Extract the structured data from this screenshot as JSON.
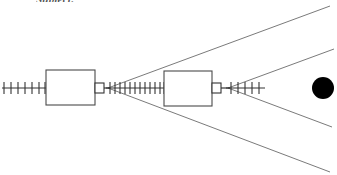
{
  "header": {
    "clipped_label": "Subject:"
  },
  "diagram": {
    "background_color": "#ffffff",
    "line_color": "#3a3a3a",
    "thin_line_color": "#6b6b6b",
    "fill_color": "#000000",
    "axis_y": 88,
    "elements": {
      "left_scale": {
        "name": "left-graduated-scale",
        "x_start": 2,
        "x_end": 46,
        "tick_count": 7,
        "tick_half_height": 6
      },
      "block_one": {
        "name": "optical-block-one",
        "x": 46,
        "y": 70,
        "width": 49,
        "height": 35,
        "label": ""
      },
      "connector_one": {
        "name": "connector-one",
        "x": 95,
        "y": 83,
        "width": 9,
        "height": 10
      },
      "vertex_one": {
        "name": "beam-vertex-one",
        "x": 108,
        "y": 88
      },
      "middle_scale": {
        "name": "middle-graduated-scale",
        "x_start": 108,
        "x_end": 164,
        "tick_count": 12,
        "tick_half_height": 6
      },
      "block_two": {
        "name": "optical-block-two",
        "x": 164,
        "y": 71,
        "width": 48,
        "height": 35,
        "label": ""
      },
      "connector_two": {
        "name": "connector-two",
        "x": 212,
        "y": 83,
        "width": 9,
        "height": 10
      },
      "vertex_two": {
        "name": "beam-vertex-two",
        "x": 228,
        "y": 88
      },
      "right_scale": {
        "name": "right-graduated-scale",
        "x_start": 228,
        "x_end": 265,
        "tick_count": 5,
        "tick_half_height": 6
      },
      "target_disc": {
        "name": "target-disc",
        "cx": 323,
        "cy": 88,
        "r": 11,
        "fill": "#000000"
      }
    },
    "beam_rays": [
      {
        "name": "ray-upper-outer",
        "from_vertex": "vertex_one",
        "x1": 108,
        "y1": 88,
        "x2": 330,
        "y2": 6
      },
      {
        "name": "ray-lower-outer",
        "from_vertex": "vertex_one",
        "x1": 108,
        "y1": 88,
        "x2": 330,
        "y2": 172
      },
      {
        "name": "ray-upper-inner",
        "from_vertex": "vertex_two",
        "x1": 228,
        "y1": 88,
        "x2": 334,
        "y2": 49
      },
      {
        "name": "ray-lower-inner",
        "from_vertex": "vertex_two",
        "x1": 228,
        "y1": 88,
        "x2": 332,
        "y2": 127
      }
    ]
  }
}
